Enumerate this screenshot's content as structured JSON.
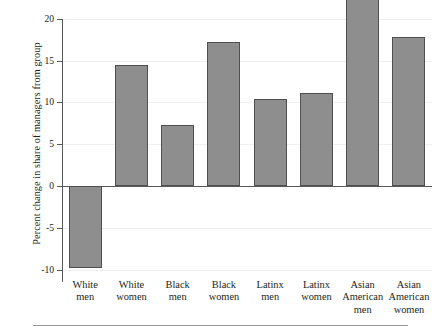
{
  "axes": {
    "ylabel": "Percent change in share of managers from group",
    "yticks": [
      "20",
      "15",
      "10",
      "5",
      "0",
      "-5",
      "-10"
    ]
  },
  "chart_data": {
    "type": "bar",
    "title": "",
    "xlabel": "",
    "ylabel": "Percent change in share of managers from group",
    "categories": [
      "White men",
      "White women",
      "Black men",
      "Black women",
      "Latinx men",
      "Latinx women",
      "Asian American men",
      "Asian American women"
    ],
    "category_lines": [
      [
        "White",
        "men"
      ],
      [
        "White",
        "women"
      ],
      [
        "Black",
        "men"
      ],
      [
        "Black",
        "women"
      ],
      [
        "Latinx",
        "men"
      ],
      [
        "Latinx",
        "women"
      ],
      [
        "Asian",
        "American",
        "men"
      ],
      [
        "Asian",
        "American",
        "women"
      ]
    ],
    "values": [
      -9.8,
      14.5,
      7.3,
      17.3,
      10.4,
      11.1,
      22.9,
      17.8
    ],
    "ylim": [
      -10,
      20
    ],
    "ytick_values": [
      20,
      15,
      10,
      5,
      0,
      -5,
      -10
    ],
    "grid": true,
    "legend": "none",
    "bar_color": "#8e8e8e",
    "bar_edge_color": "#4f4f4f",
    "axis_color": "#58595b"
  }
}
